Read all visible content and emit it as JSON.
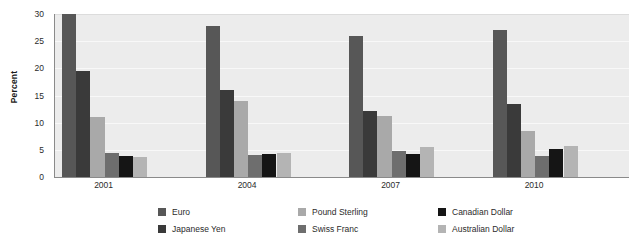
{
  "chart_data": {
    "type": "bar",
    "title": "",
    "subtitle": "",
    "xlabel": "",
    "ylabel": "Percent",
    "categories": [
      "2001",
      "2004",
      "2007",
      "2010"
    ],
    "ylim": [
      0,
      30
    ],
    "yticks": [
      0,
      5,
      10,
      15,
      20,
      25,
      30
    ],
    "ytick_labels": [
      "0",
      "5",
      "10",
      "15",
      "20",
      "25",
      "30"
    ],
    "grid": true,
    "legend_position": "bottom",
    "series": [
      {
        "name": "Euro",
        "color": "#575757",
        "values": [
          30.0,
          27.8,
          26.0,
          27.0
        ]
      },
      {
        "name": "Japanese Yen",
        "color": "#3a3a3a",
        "values": [
          19.5,
          16.0,
          12.2,
          13.5
        ]
      },
      {
        "name": "Pound Sterling",
        "color": "#a9a9a9",
        "values": [
          11.0,
          14.0,
          11.3,
          8.5
        ]
      },
      {
        "name": "Swiss Franc",
        "color": "#6e6e6e",
        "values": [
          4.5,
          4.0,
          4.7,
          3.9
        ]
      },
      {
        "name": "Canadian Dollar",
        "color": "#151515",
        "values": [
          3.8,
          4.2,
          4.3,
          5.2
        ]
      },
      {
        "name": "Australian Dollar",
        "color": "#b4b4b4",
        "values": [
          3.6,
          4.5,
          5.5,
          5.8
        ]
      }
    ]
  },
  "legend": {
    "items": [
      {
        "label": "Euro"
      },
      {
        "label": "Japanese Yen"
      },
      {
        "label": "Pound Sterling"
      },
      {
        "label": "Swiss Franc"
      },
      {
        "label": "Canadian Dollar"
      },
      {
        "label": "Australian Dollar"
      }
    ]
  },
  "colors": {
    "plot_background": "#ececec",
    "page_background": "#ffffff",
    "axis": "#8a8a8a",
    "gridline": "#f8f8f8",
    "text": "#2b2b2b"
  }
}
